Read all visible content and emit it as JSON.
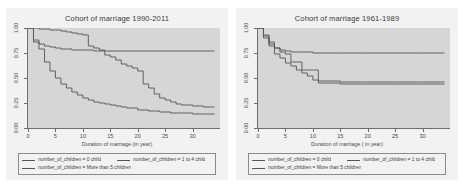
{
  "figure": {
    "background": "#ffffff",
    "panel_background": "#f2f2f2",
    "plot_background": "#d6d6d6",
    "line_color": "#555555",
    "axis_color": "#6d6d6d"
  },
  "legend": {
    "items": [
      {
        "label": "number_of_children = 0 child"
      },
      {
        "label": "number_of_children = 1 to 4 child"
      },
      {
        "label": "number_of_children = More than 5 children"
      }
    ]
  },
  "chart_data": [
    {
      "type": "line",
      "title": "Cohort of marriage 1990-2011",
      "xlabel": "Duration of marriage (in year)",
      "ylabel": "",
      "xlim": [
        0,
        35
      ],
      "ylim": [
        0,
        1
      ],
      "xticks": [
        0,
        5,
        10,
        15,
        20,
        25,
        30
      ],
      "yticks": [
        0.0,
        0.25,
        0.5,
        0.75,
        1.0
      ],
      "ytick_labels": [
        "0.00",
        "0.25",
        "0.50",
        "0.75",
        "1.00"
      ],
      "grid": false,
      "legend_position": "below",
      "series": [
        {
          "name": "number_of_children = 0 child",
          "step": "post",
          "x": [
            0,
            1,
            2,
            3,
            4,
            5,
            6,
            7,
            8,
            9,
            10,
            11,
            12,
            13,
            14,
            15,
            16,
            17,
            18,
            19,
            20,
            21,
            22,
            23,
            24,
            25,
            26,
            27,
            28,
            30,
            32,
            34
          ],
          "y": [
            1.0,
            1.0,
            0.99,
            0.99,
            0.98,
            0.98,
            0.97,
            0.96,
            0.95,
            0.94,
            0.93,
            0.82,
            0.8,
            0.78,
            0.73,
            0.71,
            0.68,
            0.64,
            0.62,
            0.6,
            0.57,
            0.44,
            0.4,
            0.34,
            0.3,
            0.28,
            0.26,
            0.24,
            0.23,
            0.22,
            0.21,
            0.21
          ]
        },
        {
          "name": "number_of_children = 1 to 4 child",
          "step": "post",
          "x": [
            0,
            1,
            2,
            3,
            4,
            5,
            6,
            8,
            10,
            12,
            14,
            20,
            25,
            30,
            34
          ],
          "y": [
            1.0,
            0.88,
            0.84,
            0.82,
            0.81,
            0.8,
            0.79,
            0.78,
            0.78,
            0.77,
            0.77,
            0.77,
            0.77,
            0.77,
            0.77
          ]
        },
        {
          "name": "number_of_children = More than 5 children",
          "step": "post",
          "x": [
            0,
            1,
            2,
            3,
            4,
            5,
            6,
            7,
            8,
            9,
            10,
            11,
            12,
            13,
            14,
            15,
            16,
            17,
            18,
            20,
            22,
            24,
            26,
            28,
            30,
            32,
            34
          ],
          "y": [
            1.0,
            0.86,
            0.79,
            0.66,
            0.57,
            0.5,
            0.44,
            0.4,
            0.36,
            0.33,
            0.3,
            0.28,
            0.26,
            0.25,
            0.24,
            0.23,
            0.22,
            0.21,
            0.2,
            0.18,
            0.17,
            0.16,
            0.15,
            0.15,
            0.14,
            0.14,
            0.14
          ]
        }
      ]
    },
    {
      "type": "line",
      "title": "Cohort of marriage 1961-1989",
      "xlabel": "Duration of marriage ( in year)",
      "ylabel": "",
      "xlim": [
        0,
        35
      ],
      "ylim": [
        0,
        1
      ],
      "xticks": [
        0,
        5,
        10,
        15,
        20,
        25,
        30
      ],
      "yticks": [
        0.0,
        0.25,
        0.5,
        0.75,
        1.0
      ],
      "ytick_labels": [
        "0.00",
        "0.25",
        "0.50",
        "0.75",
        "1.00"
      ],
      "grid": false,
      "legend_position": "below",
      "series": [
        {
          "name": "number_of_children = 0 child",
          "step": "post",
          "x": [
            0,
            1,
            2,
            3,
            4,
            5,
            6,
            7,
            8,
            9,
            10,
            11,
            12,
            15,
            20,
            25,
            30,
            34
          ],
          "y": [
            1.0,
            0.93,
            0.86,
            0.8,
            0.76,
            0.74,
            0.66,
            0.66,
            0.58,
            0.58,
            0.58,
            0.47,
            0.47,
            0.46,
            0.46,
            0.46,
            0.46,
            0.46
          ]
        },
        {
          "name": "number_of_children = 1 to 4 child",
          "step": "post",
          "x": [
            0,
            1,
            2,
            3,
            4,
            5,
            6,
            8,
            10,
            12,
            15,
            20,
            25,
            30,
            34
          ],
          "y": [
            1.0,
            0.92,
            0.84,
            0.8,
            0.78,
            0.77,
            0.76,
            0.76,
            0.75,
            0.75,
            0.75,
            0.75,
            0.75,
            0.75,
            0.75
          ]
        },
        {
          "name": "number_of_children = More than 5 children",
          "step": "post",
          "x": [
            0,
            1,
            2,
            3,
            4,
            5,
            6,
            7,
            8,
            9,
            10,
            11,
            12,
            15,
            20,
            25,
            30,
            34
          ],
          "y": [
            1.0,
            0.9,
            0.82,
            0.74,
            0.7,
            0.65,
            0.62,
            0.58,
            0.55,
            0.52,
            0.48,
            0.45,
            0.45,
            0.44,
            0.44,
            0.44,
            0.44,
            0.44
          ]
        }
      ]
    }
  ]
}
